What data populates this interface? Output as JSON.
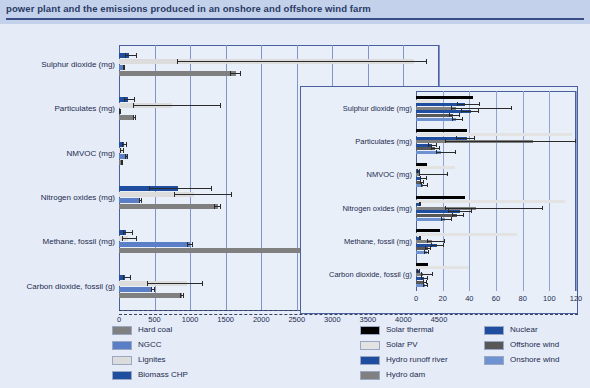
{
  "header": {
    "title": "power plant and the emissions produced in an onshore and offshore wind farm"
  },
  "chart_data": {
    "type": "bar",
    "orientation": "horizontal",
    "title": "power plant and the emissions produced in an onshore and offshore wind farm",
    "xlabel": "",
    "ylabel": "",
    "grid": true,
    "legend_position": "bottom",
    "main_panel": {
      "xlim": [
        0,
        4500
      ],
      "xticks": [
        0,
        500,
        1000,
        1500,
        2000,
        2500,
        3000,
        3500,
        4000,
        4500
      ],
      "categories": [
        "Sulphur dioxide (mg)",
        "Particulates (mg)",
        "NMVOC (mg)",
        "Nitrogen oxides (mg)",
        "Methane, fossil (mg)",
        "Carbon dioxide, fossil (g)"
      ],
      "series": [
        {
          "name": "Biomass CHP",
          "color": "#1f4ea1",
          "values": [
            140,
            120,
            70,
            830,
            100,
            90
          ],
          "err_low": [
            90,
            70,
            40,
            420,
            60,
            50
          ],
          "err_high": [
            260,
            230,
            110,
            1310,
            200,
            170
          ]
        },
        {
          "name": "Lignites",
          "color": "#dcdcdc",
          "values": [
            4150,
            740,
            40,
            1060,
            130,
            950
          ],
          "err_low": [
            820,
            200,
            20,
            770,
            40,
            400
          ],
          "err_high": [
            4330,
            1440,
            70,
            1590,
            260,
            1180
          ]
        },
        {
          "name": "NGCC",
          "color": "#5b7fc7",
          "values": [
            60,
            10,
            110,
            300,
            1000,
            470
          ],
          "err_low": [
            50,
            5,
            90,
            280,
            960,
            450
          ],
          "err_high": [
            80,
            20,
            130,
            330,
            1040,
            500
          ]
        },
        {
          "name": "Hard coal",
          "color": "#808080",
          "values": [
            1640,
            210,
            40,
            1390,
            2580,
            890
          ],
          "err_low": [
            1560,
            190,
            30,
            1340,
            2540,
            860
          ],
          "err_high": [
            1710,
            240,
            55,
            1440,
            2630,
            920
          ]
        }
      ]
    },
    "inset_panel": {
      "xlim": [
        0,
        120
      ],
      "xticks": [
        0,
        20,
        40,
        60,
        80,
        100,
        120
      ],
      "categories": [
        "Sulphur dioxide (mg)",
        "Particulates (mg)",
        "NMVOC (mg)",
        "Nitrogen oxides (mg)",
        "Methane, fossil (mg)",
        "Carbon dioxide, fossil (g)"
      ],
      "series": [
        {
          "name": "Solar thermal",
          "color": "#000000",
          "values": [
            43,
            38,
            8,
            37,
            18,
            9
          ],
          "err_low": [
            43,
            38,
            8,
            37,
            18,
            9
          ],
          "err_high": [
            43,
            38,
            8,
            37,
            18,
            9
          ]
        },
        {
          "name": "Solar PV",
          "color": "#e3e3e3",
          "values": [
            18,
            117,
            29,
            112,
            76,
            40
          ],
          "err_low": [
            18,
            117,
            29,
            112,
            76,
            40
          ],
          "err_high": [
            18,
            117,
            29,
            112,
            76,
            40
          ]
        },
        {
          "name": "Hydro runoff river",
          "color": "#1f4ea1",
          "values": [
            37,
            38,
            2,
            3,
            3,
            2
          ],
          "err_low": [
            31,
            30,
            1,
            2,
            2,
            1
          ],
          "err_high": [
            48,
            44,
            3,
            4,
            4,
            3
          ]
        },
        {
          "name": "Hydro dam",
          "color": "#808080",
          "values": [
            30,
            88,
            3,
            45,
            12,
            5
          ],
          "err_low": [
            26,
            22,
            2,
            22,
            8,
            4
          ],
          "err_high": [
            72,
            120,
            24,
            95,
            22,
            13
          ]
        },
        {
          "name": "Nuclear",
          "color": "#1f4ea1",
          "values": [
            41,
            12,
            4,
            33,
            16,
            6
          ],
          "err_low": [
            34,
            9,
            3,
            24,
            11,
            4
          ],
          "err_high": [
            47,
            16,
            8,
            42,
            21,
            9
          ]
        },
        {
          "name": "Offshore wind",
          "color": "#585858",
          "values": [
            28,
            14,
            4,
            31,
            9,
            6
          ],
          "err_low": [
            25,
            11,
            3,
            27,
            7,
            5
          ],
          "err_high": [
            33,
            18,
            6,
            36,
            11,
            8
          ]
        },
        {
          "name": "Onshore wind",
          "color": "#6f92d0",
          "values": [
            30,
            19,
            5,
            22,
            8,
            7
          ],
          "err_low": [
            27,
            15,
            4,
            19,
            6,
            5
          ],
          "err_high": [
            35,
            30,
            9,
            27,
            10,
            9
          ]
        }
      ]
    }
  },
  "legend": {
    "left_column": [
      {
        "label": "Hard coal",
        "color": "#808080"
      },
      {
        "label": "NGCC",
        "color": "#5b7fc7"
      },
      {
        "label": "Lignites",
        "color": "#dcdcdc"
      },
      {
        "label": "Biomass CHP",
        "color": "#1f4ea1"
      }
    ],
    "middle_column": [
      {
        "label": "Solar thermal",
        "color": "#000000"
      },
      {
        "label": "Solar PV",
        "color": "#e3e3e3"
      },
      {
        "label": "Hydro runoff river",
        "color": "#1f4ea1"
      },
      {
        "label": "Hydro dam",
        "color": "#808080"
      }
    ],
    "right_column": [
      {
        "label": "Nuclear",
        "color": "#1f4ea1"
      },
      {
        "label": "Offshore wind",
        "color": "#585858"
      },
      {
        "label": "Onshore wind",
        "color": "#6f92d0"
      }
    ]
  }
}
